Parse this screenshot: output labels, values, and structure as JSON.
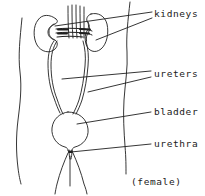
{
  "figure": {
    "caption": "(female)",
    "line_color": "#1f1f1f",
    "text_color": "#1a1a1a",
    "background_color": "#ffffff",
    "width": 205,
    "height": 196
  },
  "labels": {
    "kidneys": "kidneys",
    "ureters": "ureters",
    "bladder": "bladder",
    "urethra": "urethra"
  },
  "parts": [
    {
      "name": "torso-outline",
      "label": ""
    },
    {
      "name": "left-kidney",
      "label": "kidneys"
    },
    {
      "name": "right-kidney",
      "label": "kidneys"
    },
    {
      "name": "vertebral-column",
      "label": ""
    },
    {
      "name": "left-ureter",
      "label": "ureters"
    },
    {
      "name": "right-ureter",
      "label": "ureters"
    },
    {
      "name": "bladder",
      "label": "bladder"
    },
    {
      "name": "urethra",
      "label": "urethra"
    },
    {
      "name": "legs",
      "label": ""
    }
  ]
}
